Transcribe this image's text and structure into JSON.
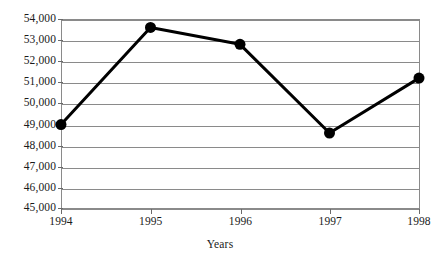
{
  "chart_data": {
    "type": "line",
    "title": "",
    "subtitle": "",
    "xlabel": "Years",
    "ylabel": "",
    "categories": [
      "1994",
      "1995",
      "1996",
      "1997",
      "1998"
    ],
    "x": [
      1994,
      1995,
      1996,
      1997,
      1998
    ],
    "values": [
      49000,
      53600,
      52800,
      48600,
      51200
    ],
    "series": [
      {
        "name": "",
        "values": [
          49000,
          53600,
          52800,
          48600,
          51200
        ]
      }
    ],
    "ylim": [
      45000,
      54000
    ],
    "ytick_labels": [
      "54,000",
      "53,000",
      "52,000",
      "51,000",
      "50,000",
      "49,000",
      "48,000",
      "47,000",
      "46,000",
      "45,000"
    ],
    "ytick_values": [
      54000,
      53000,
      52000,
      51000,
      50000,
      49000,
      48000,
      47000,
      46000,
      45000
    ],
    "xtick_labels": [
      "1994",
      "1995",
      "1996",
      "1997",
      "1998"
    ],
    "grid": true,
    "grid_axis": "y",
    "legend": false,
    "legend_position": "none",
    "marker": "filled-circle",
    "line_color": "#000000",
    "marker_color": "#000000",
    "grid_color": "#8a8a8a",
    "background_color": "#ffffff"
  }
}
